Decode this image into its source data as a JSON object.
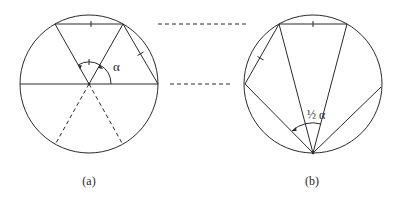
{
  "figure": {
    "panels": [
      {
        "id": "a",
        "label": "(a)",
        "angle_label": "α",
        "circle": {
          "cx": 89,
          "cy": 84,
          "r": 69
        }
      },
      {
        "id": "b",
        "label": "(b)",
        "angle_label": "½ α",
        "circle": {
          "cx": 313,
          "cy": 84,
          "r": 69
        }
      }
    ],
    "connectors": [
      {
        "type": "dashed",
        "y": 24
      },
      {
        "type": "dashed",
        "y": 84
      }
    ],
    "colors": {
      "stroke": "#2a2a2a",
      "background": "#ffffff"
    }
  }
}
